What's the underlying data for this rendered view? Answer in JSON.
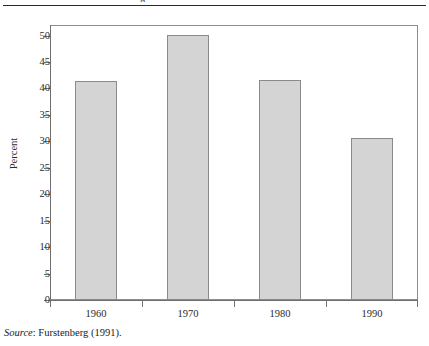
{
  "caption_fragment": "g",
  "source_note": {
    "label": "Source",
    "separator": ":",
    "text": "Furstenberg (1991)."
  },
  "colors": {
    "bar_fill": "#d4d4d4",
    "bar_stroke": "#8a8a8a",
    "axis": "#6f6f6f",
    "frame": "#8d8d8d",
    "rule": "#2b2b2b",
    "text": "#1a1a1a"
  },
  "chart_data": {
    "type": "bar",
    "title": "",
    "subtitle": "",
    "categories": [
      "1960",
      "1970",
      "1980",
      "1990"
    ],
    "values": [
      41.4,
      50.2,
      41.6,
      30.6
    ],
    "xlabel": "",
    "ylabel": "Percent",
    "ylim": [
      0,
      52
    ],
    "yticks": [
      0,
      5,
      10,
      15,
      20,
      25,
      30,
      35,
      40,
      45,
      50
    ],
    "ytick_labels": [
      "0",
      "5",
      "10",
      "15",
      "20",
      "25",
      "30",
      "35",
      "40",
      "45",
      "50"
    ],
    "grid": false,
    "legend": "none",
    "legend_position": "none"
  }
}
